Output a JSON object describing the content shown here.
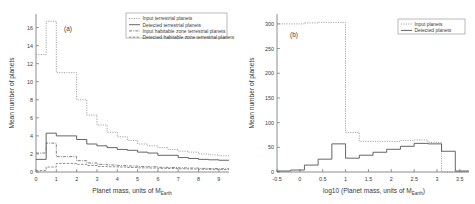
{
  "figure": {
    "background_color": "#ffffff",
    "axis_color": "#6f6f6f"
  },
  "chart_data": [
    {
      "id": "panel-a",
      "type": "line",
      "panel_tag": "(a)",
      "title": "",
      "xlabel_main": "Planet mass, units of M",
      "xlabel_sub": "Earth",
      "ylabel": "Mean number of planets",
      "xlim": [
        0,
        9.5
      ],
      "ylim": [
        0,
        17.5
      ],
      "xticks": [
        0,
        1,
        2,
        3,
        4,
        5,
        6,
        7,
        8,
        9
      ],
      "xtick_labels": [
        "0",
        "1",
        "2",
        "3",
        "4",
        "5",
        "6",
        "7",
        "8",
        "9"
      ],
      "yticks": [
        0,
        2,
        4,
        6,
        8,
        10,
        12,
        14,
        16
      ],
      "ytick_labels": [
        "0",
        "2",
        "4",
        "6",
        "8",
        "10",
        "12",
        "14",
        "16"
      ],
      "grid": false,
      "legend_position": "upper-right",
      "bin_edges": [
        0,
        0.5,
        1.0,
        1.5,
        2.0,
        2.5,
        3.0,
        3.5,
        4.0,
        4.5,
        5.0,
        5.5,
        6.0,
        6.5,
        7.0,
        7.5,
        8.0,
        8.5,
        9.0,
        9.5
      ],
      "series": [
        {
          "name": "Input terrestrial planets",
          "style": "dotted",
          "color": "#8d8d8d",
          "values": [
            13.0,
            16.7,
            11.0,
            11.0,
            8.0,
            6.3,
            5.2,
            4.4,
            3.9,
            3.5,
            3.1,
            2.9,
            2.7,
            2.5,
            2.3,
            2.2,
            2.0,
            1.9,
            1.8
          ]
        },
        {
          "name": "Detected terrestrial planets",
          "style": "solid",
          "color": "#4a4a4a",
          "values": [
            1.4,
            4.3,
            4.0,
            4.0,
            3.6,
            3.1,
            2.9,
            2.7,
            2.5,
            2.4,
            2.2,
            2.1,
            1.85,
            1.85,
            1.6,
            1.5,
            1.4,
            1.35,
            1.3
          ]
        },
        {
          "name": "Input habitable zone terrestrial planets",
          "style": "dashdot",
          "color": "#6a6a6a",
          "values": [
            2.1,
            3.2,
            1.7,
            1.7,
            1.25,
            1.0,
            0.85,
            0.78,
            0.7,
            0.66,
            0.6,
            0.58,
            0.52,
            0.5,
            0.46,
            0.44,
            0.4,
            0.38,
            0.36
          ]
        },
        {
          "name": "Detected habitable zone terrestrial planets",
          "style": "dashed",
          "color": "#7a7a7a",
          "values": [
            0.15,
            0.55,
            0.95,
            0.95,
            0.85,
            0.72,
            0.62,
            0.58,
            0.55,
            0.5,
            0.46,
            0.44,
            0.4,
            0.38,
            0.35,
            0.33,
            0.3,
            0.28,
            0.27
          ]
        }
      ]
    },
    {
      "id": "panel-b",
      "type": "line",
      "panel_tag": "(b)",
      "title": "",
      "xlabel_main": "log10 (Planet mass, units of M",
      "xlabel_sub": "Earth",
      "xlabel_tail": ")",
      "ylabel": "Mean number of planets",
      "xlim": [
        -0.5,
        3.7
      ],
      "ylim": [
        0,
        320
      ],
      "xticks": [
        -0.5,
        0,
        0.5,
        1,
        1.5,
        2,
        2.5,
        3,
        3.5
      ],
      "xtick_labels": [
        "-0.5",
        "0",
        "0.5",
        "1",
        "1.5",
        "2",
        "2.5",
        "3",
        "3.5"
      ],
      "yticks": [
        0,
        50,
        100,
        150,
        200,
        250,
        300
      ],
      "ytick_labels": [
        "0",
        "50",
        "100",
        "150",
        "200",
        "250",
        "300"
      ],
      "grid": false,
      "legend_position": "upper-right",
      "bin_edges": [
        -0.5,
        -0.2,
        0.1,
        0.4,
        0.7,
        1.0,
        1.3,
        1.6,
        1.9,
        2.2,
        2.5,
        2.8,
        3.1,
        3.4,
        3.7
      ],
      "series": [
        {
          "name": "Input planets",
          "style": "dotted",
          "color": "#8d8d8d",
          "values": [
            300,
            300,
            302,
            303,
            303,
            80,
            62,
            62,
            62,
            64,
            65,
            60,
            0,
            0
          ]
        },
        {
          "name": "Detected planets",
          "style": "solid",
          "color": "#4a4a4a",
          "values": [
            2,
            4,
            14,
            26,
            57,
            28,
            34,
            40,
            46,
            52,
            58,
            57,
            42,
            2
          ]
        }
      ]
    }
  ]
}
